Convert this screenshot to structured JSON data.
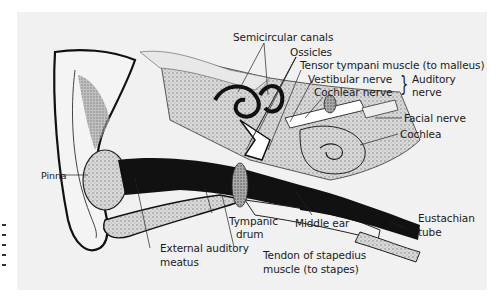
{
  "figure": {
    "labels": {
      "semicircular_canals": "Semicircular canals",
      "ossicles": "Ossicles",
      "tensor_tympani": "Tensor tympani muscle (to malleus)",
      "vestibular_nerve": "Vestibular nerve",
      "cochlear_nerve": "Cochlear nerve",
      "auditory_nerve_line1": "Auditory",
      "auditory_nerve_line2": "nerve",
      "facial_nerve": "Facial nerve",
      "cochlea": "Cochlea",
      "pinna": "Pinna",
      "tympanic_drum_line1": "Tympanic",
      "tympanic_drum_line2": "drum",
      "middle_ear": "Middle ear",
      "eustachian_tube_line1": "Eustachian",
      "eustachian_tube_line2": "tube",
      "external_meatus_line1": "External auditory",
      "external_meatus_line2": "meatus",
      "stapedius_line1": "Tendon of stapedius",
      "stapedius_line2": "muscle (to stapes)"
    },
    "brace_glyph": "}"
  }
}
